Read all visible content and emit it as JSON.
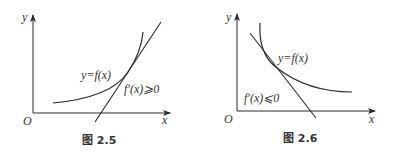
{
  "figures": [
    {
      "id": "left",
      "caption": "图 2.5",
      "axis_y_label": "y",
      "axis_x_label": "x",
      "origin_label": "O",
      "curve_label": "y=f(x)",
      "condition_label": "f′(x)⩾0",
      "description": "increasing curve with tangent line of positive slope"
    },
    {
      "id": "right",
      "caption": "图 2.6",
      "axis_y_label": "y",
      "axis_x_label": "x",
      "origin_label": "O",
      "curve_label": "y=f(x)",
      "condition_label": "f′(x)⩽0",
      "description": "decreasing curve with tangent line of negative slope"
    }
  ],
  "colors": {
    "stroke": "#2a2a2a",
    "background": "#ffffff"
  }
}
